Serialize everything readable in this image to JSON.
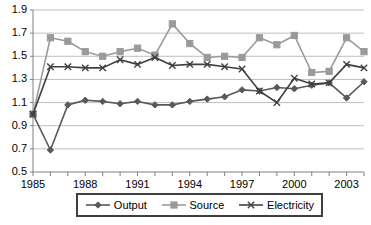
{
  "chart_data": {
    "type": "line",
    "title": "",
    "xlabel": "",
    "ylabel": "",
    "xlim": [
      1985,
      2004
    ],
    "ylim": [
      0.5,
      1.9
    ],
    "ytick_step": 0.2,
    "grid": "horizontal",
    "legend_position": "bottom",
    "x": [
      1985,
      1986,
      1987,
      1988,
      1989,
      1990,
      1991,
      1992,
      1993,
      1994,
      1995,
      1996,
      1997,
      1998,
      1999,
      2000,
      2001,
      2002,
      2003,
      2004
    ],
    "xtick_labels": [
      "1985",
      "1988",
      "1991",
      "1994",
      "1997",
      "2000",
      "2003"
    ],
    "xtick_values": [
      1985,
      1988,
      1991,
      1994,
      1997,
      2000,
      2003
    ],
    "ytick_labels": [
      "1.9",
      "1.7",
      "1.5",
      "1.3",
      "1.1",
      "0.9",
      "0.7",
      "0.5"
    ],
    "ytick_values": [
      1.9,
      1.7,
      1.5,
      1.3,
      1.1,
      0.9,
      0.7,
      0.5
    ],
    "series": [
      {
        "name": "Output",
        "marker": "diamond",
        "color": "#595959",
        "values": [
          1.0,
          0.69,
          1.08,
          1.12,
          1.11,
          1.09,
          1.11,
          1.08,
          1.08,
          1.11,
          1.13,
          1.15,
          1.21,
          1.2,
          1.23,
          1.22,
          1.25,
          1.27,
          1.14,
          1.28
        ]
      },
      {
        "name": "Source",
        "marker": "square",
        "color": "#9a9a9a",
        "values": [
          1.0,
          1.66,
          1.63,
          1.54,
          1.5,
          1.54,
          1.57,
          1.51,
          1.78,
          1.61,
          1.49,
          1.5,
          1.49,
          1.66,
          1.6,
          1.68,
          1.36,
          1.37,
          1.66,
          1.54
        ]
      },
      {
        "name": "Electricity",
        "marker": "cross",
        "color": "#404040",
        "values": [
          1.0,
          1.41,
          1.41,
          1.4,
          1.4,
          1.47,
          1.43,
          1.49,
          1.42,
          1.43,
          1.43,
          1.41,
          1.39,
          1.2,
          1.1,
          1.31,
          1.26,
          1.27,
          1.43,
          1.4
        ]
      }
    ]
  },
  "legend": {
    "items": [
      {
        "label": "Output"
      },
      {
        "label": "Source"
      },
      {
        "label": "Electricity"
      }
    ]
  },
  "colors": {
    "axis": "#808080",
    "grid": "#bfbfbf",
    "legend_border": "#3f3f3f",
    "text": "#000000",
    "background": "#ffffff"
  }
}
